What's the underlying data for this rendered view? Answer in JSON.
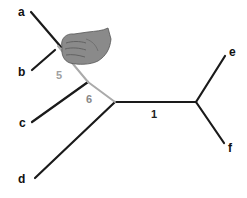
{
  "diagram": {
    "type": "phylogenetic-tree",
    "tips": [
      {
        "label": "a",
        "x": 27,
        "y": 14
      },
      {
        "label": "b",
        "x": 24,
        "y": 75
      },
      {
        "label": "c",
        "x": 24,
        "y": 127
      },
      {
        "label": "d",
        "x": 20,
        "y": 184
      },
      {
        "label": "e",
        "x": 229,
        "y": 57
      },
      {
        "label": "f",
        "x": 228,
        "y": 151
      }
    ],
    "branches": [
      {
        "label": "5",
        "color": "#a0a0a0",
        "x": 57,
        "y": 78
      },
      {
        "label": "6",
        "color": "#888888",
        "x": 87,
        "y": 105
      },
      {
        "label": "1",
        "color": "#222222",
        "x": 151,
        "y": 117
      }
    ],
    "overlay": {
      "icon": "hand-grab-icon",
      "color": "#8a8a8a"
    },
    "colors": {
      "edge": "#1a1a1a",
      "highlight_edge": "#aaaaaa"
    }
  }
}
